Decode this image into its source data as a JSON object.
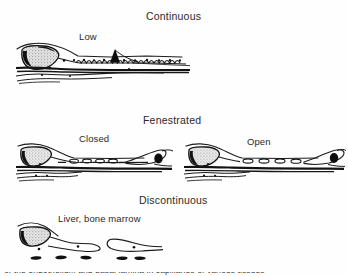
{
  "figure": {
    "background_color": "#fefefe",
    "ink_color": "#1b1b1b",
    "width": 348,
    "height": 276
  },
  "rows": [
    {
      "heading": "Continuous",
      "sub_labels": [
        "Low"
      ],
      "panels": [
        "continuous-capillary"
      ]
    },
    {
      "heading": "Fenestrated",
      "sub_labels": [
        "Closed",
        "Open"
      ],
      "panels": [
        "fenestrated-closed-capillary",
        "fenestrated-open-capillary"
      ]
    },
    {
      "heading": "Discontinuous",
      "sub_labels": [
        "Liver, bone marrow"
      ],
      "panels": [
        "discontinuous-capillary"
      ]
    }
  ],
  "headings": {
    "continuous": "Continuous",
    "fenestrated": "Fenestrated",
    "discontinuous": "Discontinuous"
  },
  "sub_labels": {
    "low": "Low",
    "closed": "Closed",
    "open": "Open",
    "liver_bone_marrow": "Liver, bone marrow"
  },
  "caption_sliver": "of the endothelium and basal lamina in capillaries of various tissues"
}
